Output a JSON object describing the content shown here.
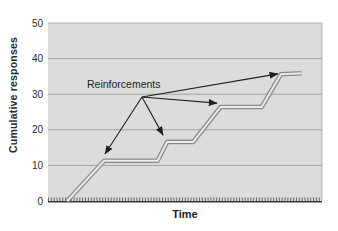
{
  "figure": {
    "ylabel": "Cumulative responses",
    "xlabel": "Time",
    "annotation_label": "Reinforcements"
  },
  "colors": {
    "plot_bg": "#dcdcda",
    "gridline": "#a2a2a0",
    "plot_edge": "#b3b3b1",
    "axis_line": "#3a3a38",
    "axis_tick": "#4a4a48",
    "curve_outer": "#8a8a88",
    "curve_inner": "#eaeae8",
    "arrow": "#1f1f1f",
    "tick_text": "#2b2b2b"
  },
  "chart_data": {
    "type": "line",
    "title": "",
    "xlabel": "Time",
    "ylabel": "Cumulative responses",
    "xlim": [
      0,
      100
    ],
    "ylim": [
      0,
      50
    ],
    "yticks": [
      0,
      10,
      20,
      30,
      40,
      50
    ],
    "xticks": "dense unlabeled ruler hatch marks along time axis",
    "grid": "horizontal only",
    "legend": "none",
    "series": [
      {
        "name": "cumulative-record",
        "style": "double-line (light core with dark edges), step-like cumulative record with pauses after each reinforcement",
        "points": [
          [
            7,
            0
          ],
          [
            20.5,
            11.3
          ],
          [
            40,
            11.3
          ],
          [
            43.5,
            16.6
          ],
          [
            53,
            16.6
          ],
          [
            63,
            26.4
          ],
          [
            78,
            26.4
          ],
          [
            85,
            35.6
          ],
          [
            92.5,
            35.9
          ]
        ]
      }
    ],
    "annotations": [
      {
        "label": "Reinforcements",
        "origin": [
          34.3,
          29.2
        ],
        "targets": [
          [
            20.8,
            13.2
          ],
          [
            42.0,
            18.5
          ],
          [
            61.7,
            27.5
          ],
          [
            83.9,
            35.7
          ]
        ]
      }
    ]
  }
}
